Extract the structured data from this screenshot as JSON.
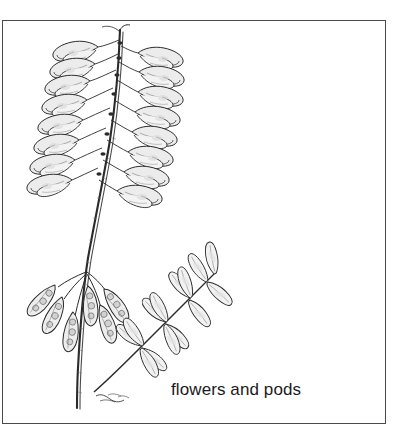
{
  "figure": {
    "kind": "botanical-line-illustration",
    "caption": "flowers and pods",
    "background_color": "#ffffff",
    "ink_color": "#2b2b2b",
    "shade_color": "#d8d8d8",
    "frame": {
      "border_color": "#4a4a4a",
      "border_width_px": 1,
      "x": 2,
      "y": 20,
      "width": 384,
      "height": 404
    },
    "signature": {
      "present": true,
      "label": "artist-signature",
      "x": 95,
      "y": 399
    },
    "parts": [
      {
        "name": "flower-raceme",
        "label": "flowers",
        "region": "upper-left"
      },
      {
        "name": "seed-pod-cluster",
        "label": "pods",
        "region": "lower-left"
      },
      {
        "name": "compound-leaf",
        "label": "pinnate leaf",
        "region": "center-right"
      },
      {
        "name": "main-stem",
        "label": "stem",
        "region": "center"
      }
    ],
    "flowers": {
      "count_left": 8,
      "count_right": 8,
      "arrangement": "drooping raceme, two ranks"
    },
    "pods": {
      "count": 6,
      "arrangement": "pendent cluster"
    },
    "leaflets": {
      "count": 14,
      "arrangement": "pinnate, opposite pairs"
    }
  }
}
